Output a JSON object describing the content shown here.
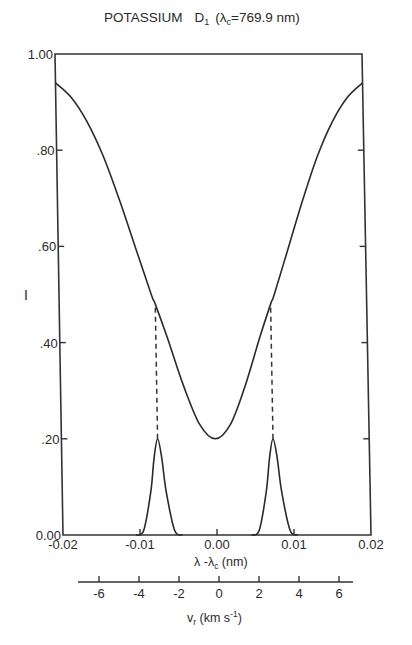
{
  "chart_data": {
    "type": "line",
    "title_parts": {
      "element": "POTASSIUM",
      "line": "D",
      "line_sub": "1",
      "lambda_expr": "(λ",
      "lambda_sub": "c",
      "lambda_value": "=769.9 nm)"
    },
    "xlabel": "λ - λc (nm)",
    "xlabel_parts": {
      "a": "λ -λ",
      "sub": "c",
      "b": " (nm)"
    },
    "ylabel": "I",
    "xlim": [
      -0.02,
      0.02
    ],
    "ylim": [
      0.0,
      1.0
    ],
    "x_ticks": [
      "-0.02",
      "-0.01",
      "0.00",
      "0.01",
      "0.02"
    ],
    "y_ticks": [
      "0.00",
      ".20",
      ".40",
      ".60",
      ".80",
      "1.00"
    ],
    "secondary_x_axis": {
      "label": "v_r (km s⁻¹)",
      "label_parts": {
        "a": "v",
        "sub": "r",
        "b": " (km s",
        "sup": "-1",
        "c": ")"
      },
      "ticks": [
        "-6",
        "-4",
        "-2",
        "0",
        "2",
        "4",
        "6"
      ]
    },
    "grid": false,
    "legend": null,
    "series": [
      {
        "name": "Line profile (intensity)",
        "style": "solid",
        "x": [
          -0.02,
          -0.018,
          -0.016,
          -0.014,
          -0.012,
          -0.01,
          -0.008,
          -0.0075,
          -0.006,
          -0.004,
          -0.002,
          0.0,
          0.002,
          0.004,
          0.006,
          0.0075,
          0.008,
          0.01,
          0.012,
          0.014,
          0.016,
          0.018,
          0.02
        ],
        "y": [
          0.94,
          0.91,
          0.86,
          0.79,
          0.7,
          0.6,
          0.5,
          0.48,
          0.41,
          0.31,
          0.23,
          0.2,
          0.23,
          0.31,
          0.41,
          0.48,
          0.5,
          0.6,
          0.7,
          0.79,
          0.86,
          0.91,
          0.94
        ]
      },
      {
        "name": "Filter passband (left)",
        "style": "solid",
        "x": [
          -0.0105,
          -0.0095,
          -0.0085,
          -0.008,
          -0.0075,
          -0.007,
          -0.0065,
          -0.0055,
          -0.0045
        ],
        "y": [
          0.0,
          0.01,
          0.09,
          0.16,
          0.2,
          0.16,
          0.09,
          0.01,
          0.0
        ]
      },
      {
        "name": "Filter passband (right)",
        "style": "solid",
        "x": [
          0.0045,
          0.0055,
          0.0065,
          0.007,
          0.0075,
          0.008,
          0.0085,
          0.0095,
          0.0105
        ],
        "y": [
          0.0,
          0.01,
          0.09,
          0.16,
          0.2,
          0.16,
          0.09,
          0.01,
          0.0
        ]
      },
      {
        "name": "Dashed markers",
        "style": "dashed",
        "x": [
          -0.0075,
          0.0075
        ],
        "y_from": [
          0.2,
          0.2
        ],
        "y_to": [
          0.48,
          0.48
        ]
      }
    ]
  }
}
